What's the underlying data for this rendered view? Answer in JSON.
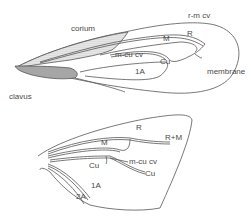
{
  "diagram": {
    "forewing": {
      "labels": {
        "corium": "corium",
        "clavus": "clavus",
        "membrane": "membrane",
        "rm_cv": "r-m cv",
        "m": "M",
        "r": "R",
        "mcu_cv": "m-cu cv",
        "cu": "Cu",
        "a1": "1A"
      }
    },
    "hindwing": {
      "labels": {
        "r": "R",
        "rm": "R+M",
        "m": "M",
        "mcu_cv": "m-cu cv",
        "cu_inner": "Cu",
        "cu_outer": "Cu",
        "a1": "1A",
        "a2": "2A"
      }
    },
    "colors": {
      "line": "#555555",
      "stipple": "#777777",
      "text": "#4a4a4a"
    }
  }
}
